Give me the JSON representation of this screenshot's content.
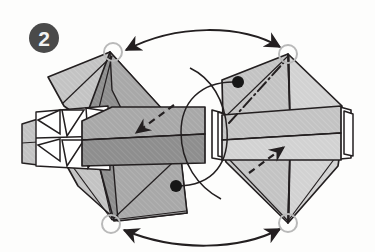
{
  "figure": {
    "kind": "origami-folding-diagram",
    "step_number": "2",
    "step_badge": {
      "name": "step-number-badge",
      "fill": "#4a4a4a",
      "text_color": "#f2f2f2",
      "cx": 44,
      "cy": 38,
      "r": 15
    },
    "canvas": {
      "width": 375,
      "height": 252,
      "background": "#fdfdfc"
    },
    "palette": {
      "ink": "#231f20",
      "shade_dark": "#8e8e8e",
      "shade_mid": "#a8a8a8",
      "shade_light": "#c3c3c3",
      "shade_pale": "#d2d2d2",
      "paper_white": "#ffffff",
      "badge_gray": "#4a4a4a",
      "dot_black": "#161616"
    }
  },
  "left_model": {
    "name": "left-folded-model",
    "label": "left model",
    "faces": [
      {
        "name": "left-upper-left-panel",
        "tone": "shade_light",
        "points": "48,77 110,52 126,112 88,123 64,106"
      },
      {
        "name": "left-upper-right-panel",
        "tone": "shade_mid",
        "points": "110,52 168,116 126,128 88,123 126,112"
      },
      {
        "name": "left-lower-left-panel",
        "tone": "shade_light",
        "points": "64,140 112,148 116,220 78,186 58,150"
      },
      {
        "name": "left-lower-right-panel",
        "tone": "shade_mid",
        "points": "112,148 186,148 186,212 116,220"
      },
      {
        "name": "left-center-core-upper",
        "tone": "shade_dark",
        "points": "110,52 168,116 126,128 86,122"
      },
      {
        "name": "left-center-core-lower",
        "tone": "shade_dark",
        "points": "95,150 178,150 186,212 116,220"
      },
      {
        "name": "left-band-top-face",
        "tone": "shade_mid",
        "points": "82,118 112,108 205,108 205,135 82,140"
      },
      {
        "name": "left-band-front-face",
        "tone": "shade_dark",
        "points": "82,140 205,135 205,163 82,166"
      },
      {
        "name": "left-edge-block",
        "tone": "shade_light",
        "points": "22,124 36,120 36,164 22,162"
      }
    ],
    "pleat_triangles": [
      {
        "name": "pleat-triangle-upper-a",
        "points": "38,121 60,112 60,134"
      },
      {
        "name": "pleat-triangle-upper-b",
        "points": "62,112 84,112 68,136"
      },
      {
        "name": "pleat-triangle-upper-c",
        "points": "86,110 104,112 88,136"
      },
      {
        "name": "pleat-triangle-lower-a",
        "points": "38,144 60,138 60,160"
      },
      {
        "name": "pleat-triangle-lower-b",
        "points": "62,140 84,140 68,164"
      },
      {
        "name": "pleat-triangle-lower-c",
        "points": "86,140 104,142 88,166"
      }
    ],
    "vertices": {
      "top": {
        "name": "left-top-vertex",
        "x": 113,
        "y": 54
      },
      "bottom": {
        "name": "left-bottom-vertex",
        "x": 110,
        "y": 222
      }
    }
  },
  "right_model": {
    "name": "right-folded-model",
    "label": "right model",
    "faces": [
      {
        "name": "right-upper-left-panel",
        "tone": "shade_light",
        "points": "222,78 288,54 290,116 224,118"
      },
      {
        "name": "right-upper-right-panel",
        "tone": "shade_pale",
        "points": "288,54 340,104 338,116 290,116"
      },
      {
        "name": "right-lower-left-panel",
        "tone": "shade_light",
        "points": "224,152 290,152 288,222 226,160"
      },
      {
        "name": "right-lower-right-panel",
        "tone": "shade_pale",
        "points": "290,152 338,152 336,164 288,222"
      },
      {
        "name": "right-band-top-face",
        "tone": "shade_light",
        "points": "222,114 340,106 341,134 222,140"
      },
      {
        "name": "right-band-front-face",
        "tone": "shade_pale",
        "points": "222,140 341,134 341,160 222,160"
      }
    ],
    "edge_flaps_left": [
      {
        "name": "right-flap-left-outer",
        "points": "213,110 222,112 222,160 213,158"
      },
      {
        "name": "right-flap-left-inner",
        "points": "219,112 226,114 226,158 219,156"
      }
    ],
    "edge_flaps_right": [
      {
        "name": "right-flap-right-outer",
        "points": "341,108 350,110 350,158 341,158"
      },
      {
        "name": "right-flap-right-inner",
        "points": "345,112 352,114 352,156 345,154"
      }
    ],
    "vertices": {
      "top": {
        "name": "right-top-vertex",
        "x": 288,
        "y": 56
      },
      "bottom": {
        "name": "right-bottom-vertex",
        "x": 288,
        "y": 222
      }
    }
  },
  "markers": {
    "hollow_circles": [
      {
        "name": "reference-circle-top-left",
        "cx": 113,
        "cy": 52,
        "r": 9
      },
      {
        "name": "reference-circle-top-right",
        "cx": 288,
        "cy": 54,
        "r": 9
      },
      {
        "name": "reference-circle-bottom-left",
        "cx": 111,
        "cy": 224,
        "r": 9
      },
      {
        "name": "reference-circle-bottom-right",
        "cx": 288,
        "cy": 223,
        "r": 9
      }
    ],
    "solid_dots": [
      {
        "name": "reference-dot-left-model",
        "cx": 176,
        "cy": 186,
        "r": 6
      },
      {
        "name": "reference-dot-right-model",
        "cx": 238,
        "cy": 82,
        "r": 6
      }
    ]
  },
  "arrows": {
    "matching_curves": [
      {
        "name": "matching-arrow-top",
        "style": "double-headed-curve",
        "path": "M 124,50 C 175,26 240,26 282,48"
      },
      {
        "name": "matching-arrow-bottom",
        "style": "double-headed-curve",
        "path": "M 122,230 C 175,252 240,250 282,229"
      }
    ],
    "leader_curves": [
      {
        "name": "leader-curve-left-dot",
        "style": "plain-curve",
        "path": "M 176,186 C 215,186 228,160 226,130 C 224,100 210,78 190,68"
      },
      {
        "name": "leader-curve-right-dot",
        "style": "plain-curve",
        "path": "M 238,82 C 200,80 182,104 182,132 C 182,162 198,186 220,198"
      }
    ],
    "fold_arrows": [
      {
        "name": "tuck-arrow-left",
        "style": "dashed-arrow",
        "path": "M 173,106 L 134,134",
        "head_at": "end"
      },
      {
        "name": "tuck-arrow-right",
        "style": "dashed-arrow",
        "path": "M 250,172 L 285,148",
        "head_at": "end"
      }
    ],
    "crease_lines": [
      {
        "name": "mountain-crease-right",
        "style": "dash-dot-line",
        "path": "M 229,123 L 286,60"
      }
    ]
  }
}
